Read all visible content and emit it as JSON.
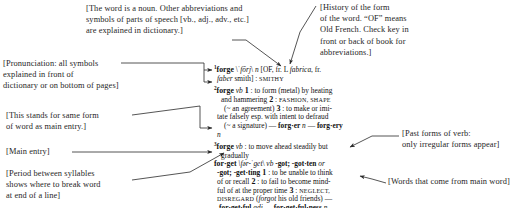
{
  "page": {
    "background_color": "#ffffff",
    "text_color": "#1b1b1b"
  },
  "annotations": {
    "part_of_speech": {
      "name": "part-of-speech-note",
      "text": "[The word is a noun. Other abbreviations and\nsymbols of parts of speech [vb., adj., adv., etc.]\nare explained in dictionary.]"
    },
    "etymology": {
      "name": "etymology-note",
      "text": "[History of the form\nof the word. “OF” means\nOld French. Check key in\nfront or back of book for\nabbreviations.]"
    },
    "pronunciation": {
      "name": "pronunciation-note",
      "text": "[Pronunciation: all symbols\nexplained in front of\ndictionary or on bottom of pages]"
    },
    "same_form": {
      "name": "same-form-note",
      "text": "[This stands for same form\nof word as main entry.]"
    },
    "main_entry": {
      "name": "main-entry-note",
      "text": "[Main entry]"
    },
    "syllable_period": {
      "name": "syllable-period-note",
      "text": "[Period between syllables\nshows where to break word\nat end of a line]"
    },
    "past_forms": {
      "name": "past-forms-note",
      "text": "[Past forms of verb:\nonly irregular forms appear]"
    },
    "derived_words": {
      "name": "derived-words-note",
      "text": "[Words that come from main word]"
    }
  },
  "entry": {
    "lines": [
      {
        "id": "forge1-l1",
        "segments": [
          {
            "t": "1",
            "s": "sup"
          },
          {
            "t": "forge",
            "s": "hw"
          },
          {
            "t": " \\",
            "s": "plain"
          },
          {
            "t": "ˈfōrj",
            "s": "italic"
          },
          {
            "t": "\\ ",
            "s": "plain"
          },
          {
            "t": "n",
            "s": "italic"
          },
          {
            "t": " [",
            "s": "plain"
          },
          {
            "t": "OF",
            "s": "plain"
          },
          {
            "t": ", fr. L ",
            "s": "plain"
          },
          {
            "t": "fabrica",
            "s": "italic"
          },
          {
            "t": ", fr.",
            "s": "plain"
          }
        ]
      },
      {
        "id": "forge1-l2",
        "indent": "i2",
        "segments": [
          {
            "t": "faber",
            "s": "italic"
          },
          {
            "t": " smith] ",
            "s": "plain"
          },
          {
            "t": ":",
            "s": "plain"
          },
          {
            "t": " SMITHY",
            "s": "sc"
          }
        ]
      },
      {
        "id": "forge2-l1",
        "segments": [
          {
            "t": "2",
            "s": "sup"
          },
          {
            "t": "forge",
            "s": "hw"
          },
          {
            "t": " ",
            "s": "plain"
          },
          {
            "t": "vb",
            "s": "italic"
          },
          {
            "t": " 1",
            "s": "num"
          },
          {
            "t": " : to form (metal) by heating",
            "s": "plain"
          }
        ]
      },
      {
        "id": "forge2-l2",
        "indent": "i1",
        "segments": [
          {
            "t": "and hammering",
            "s": "plain"
          },
          {
            "t": "  2",
            "s": "num"
          },
          {
            "t": " : ",
            "s": "plain"
          },
          {
            "t": "FASHION, SHAPE",
            "s": "sc"
          }
        ]
      },
      {
        "id": "forge2-l3",
        "indent": "i3",
        "segments": [
          {
            "t": "(~ an agreement)",
            "s": "plain"
          },
          {
            "t": "  3",
            "s": "num"
          },
          {
            "t": " : to make or imi-",
            "s": "plain"
          }
        ]
      },
      {
        "id": "forge2-l4",
        "indent": "i2",
        "segments": [
          {
            "t": "tate falsely esp. with intent to defraud",
            "s": "plain"
          }
        ]
      },
      {
        "id": "forge2-l5",
        "indent": "i3",
        "segments": [
          {
            "t": "(~ a signature) — ",
            "s": "plain"
          },
          {
            "t": "forg·er",
            "s": "bold"
          },
          {
            "t": " n",
            "s": "italic"
          },
          {
            "t": " — ",
            "s": "plain"
          },
          {
            "t": "forg·ery",
            "s": "bold"
          }
        ]
      },
      {
        "id": "forge2-l6",
        "indent": "i2",
        "segments": [
          {
            "t": "n",
            "s": "italic"
          }
        ]
      },
      {
        "id": "forge3-l1",
        "segments": [
          {
            "t": "3",
            "s": "sup"
          },
          {
            "t": "forge",
            "s": "hw"
          },
          {
            "t": " ",
            "s": "plain"
          },
          {
            "t": "vb",
            "s": "italic"
          },
          {
            "t": " : to move ahead steadily but",
            "s": "plain"
          }
        ]
      },
      {
        "id": "forge3-l2",
        "indent": "i1",
        "segments": [
          {
            "t": "gradually",
            "s": "plain"
          }
        ]
      },
      {
        "id": "forget-l1",
        "segments": [
          {
            "t": "for·get",
            "s": "hw"
          },
          {
            "t": " \\fər-",
            "s": "italic"
          },
          {
            "t": "ˈget",
            "s": "italic"
          },
          {
            "t": "\\ ",
            "s": "plain"
          },
          {
            "t": "vb",
            "s": "italic"
          },
          {
            "t": " -got;",
            "s": "bold"
          },
          {
            "t": " -got·ten",
            "s": "bold"
          },
          {
            "t": " or",
            "s": "italic"
          }
        ]
      },
      {
        "id": "forget-l2",
        "indent": "i2",
        "segments": [
          {
            "t": "-got;",
            "s": "bold"
          },
          {
            "t": " -get·ting",
            "s": "bold"
          },
          {
            "t": " 1",
            "s": "num"
          },
          {
            "t": " : to be unable to think",
            "s": "plain"
          }
        ]
      },
      {
        "id": "forget-l3",
        "indent": "i2",
        "segments": [
          {
            "t": "of or recall",
            "s": "plain"
          },
          {
            "t": "  2",
            "s": "num"
          },
          {
            "t": " : to fail to become mind-",
            "s": "plain"
          }
        ]
      },
      {
        "id": "forget-l4",
        "indent": "i2",
        "segments": [
          {
            "t": "ful of at the proper time",
            "s": "plain"
          },
          {
            "t": "  3",
            "s": "num"
          },
          {
            "t": " : ",
            "s": "plain"
          },
          {
            "t": "NEGLECT,",
            "s": "sc"
          }
        ]
      },
      {
        "id": "forget-l5",
        "indent": "i2",
        "segments": [
          {
            "t": "DISREGARD",
            "s": "sc"
          },
          {
            "t": " (",
            "s": "plain"
          },
          {
            "t": "forgot",
            "s": "italic"
          },
          {
            "t": " his old friends) —",
            "s": "plain"
          }
        ]
      },
      {
        "id": "forget-l6",
        "indent": "i4",
        "segments": [
          {
            "t": "for·get·ful",
            "s": "bold"
          },
          {
            "t": " adj",
            "s": "italic"
          },
          {
            "t": " — ",
            "s": "plain"
          },
          {
            "t": "for·get·ful·ness",
            "s": "bold"
          },
          {
            "t": " n",
            "s": "italic"
          }
        ]
      }
    ]
  },
  "leader_color": "#2a2a2a"
}
